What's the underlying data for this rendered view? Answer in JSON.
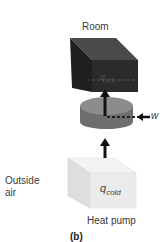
{
  "figure": {
    "panel_label": "(b)",
    "caption": "Heat pump",
    "labels": {
      "room": "Room",
      "outside_line1": "Outside",
      "outside_line2": "air",
      "work": "w",
      "q_hot_base": "q",
      "q_hot_sub": "hot",
      "q_cold_base": "q",
      "q_cold_sub": "cold"
    },
    "colors": {
      "room_front": "#2b2b2b",
      "room_top": "#4a4a4a",
      "room_side": "#1e1e1e",
      "cold_front": "#ebebeb",
      "cold_top": "#f5f5f5",
      "cold_side": "#dddddd",
      "disk_top": "#8c8c8c",
      "disk_side": "#6e6e6e",
      "arrow": "#111111"
    }
  }
}
